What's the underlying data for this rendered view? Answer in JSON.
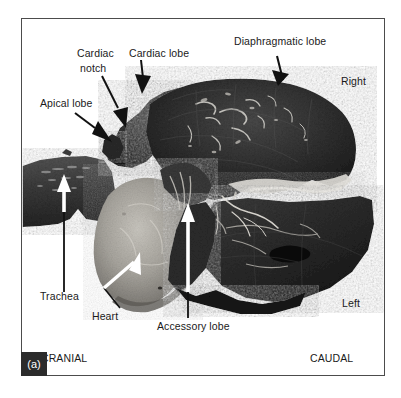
{
  "figure": {
    "panel_tag": "(a)",
    "frame_color": "#4c4c4c",
    "background_color": "#ffffff",
    "text_color": "#1a1a1a",
    "panel_tag_bg": "#2b2b2b"
  },
  "labels": {
    "apical_lobe": "Apical lobe",
    "cardiac_notch_line1": "Cardiac",
    "cardiac_notch_line2": "notch",
    "cardiac_lobe": "Cardiac lobe",
    "diaphragmatic_lobe": "Diaphragmatic lobe",
    "trachea": "Trachea",
    "heart": "Heart",
    "accessory_lobe": "Accessory lobe"
  },
  "orientation": {
    "right": "Right",
    "left": "Left",
    "cranial": "CRANIAL",
    "caudal": "CAUDAL"
  },
  "leaders": {
    "apical_lobe": {
      "style": "black-arrow",
      "direction": "down-right"
    },
    "cardiac_notch": {
      "style": "black-arrow",
      "direction": "down-right"
    },
    "cardiac_lobe": {
      "style": "black-arrow",
      "direction": "down"
    },
    "diaphragmatic_lobe": {
      "style": "black-arrow",
      "direction": "down"
    },
    "trachea": {
      "style": "white-arrow-black-stem",
      "direction": "up"
    },
    "heart": {
      "style": "white-arrow-black-stem",
      "direction": "up-left"
    },
    "accessory_lobe": {
      "style": "white-arrow-black-stem",
      "direction": "up"
    }
  }
}
